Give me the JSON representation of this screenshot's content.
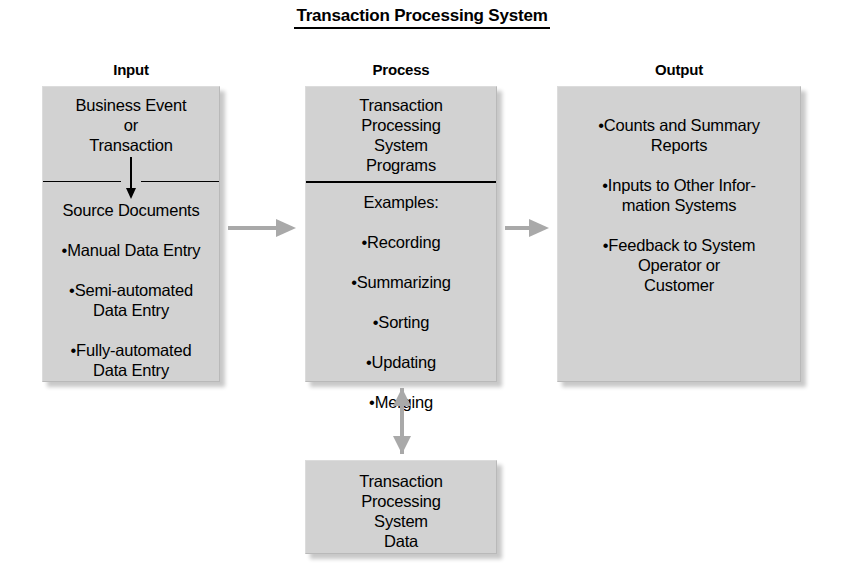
{
  "diagram": {
    "title": "Transaction Processing System",
    "colors": {
      "box_fill": "#d2d2d2",
      "arrow": "#a9a9a9",
      "text": "#000000",
      "background": "#ffffff"
    },
    "columns": [
      {
        "key": "input",
        "header": "Input"
      },
      {
        "key": "process",
        "header": "Process"
      },
      {
        "key": "output",
        "header": "Output"
      }
    ],
    "input_box": {
      "top_text": "Business Event\nor\nTransaction",
      "arrow_icon": "down-arrow-icon",
      "bottom_heading": "Source Documents",
      "bullets": [
        "•Manual Data Entry",
        "•Semi-automated\nData Entry",
        "•Fully-automated\nData Entry"
      ]
    },
    "process_box": {
      "top_text": "Transaction\nProcessing\nSystem\nPrograms",
      "bottom_heading": "Examples:",
      "bullets": [
        "•Recording",
        "•Summarizing",
        "•Sorting",
        "•Updating",
        "•Merging"
      ]
    },
    "output_box": {
      "bullets": [
        "•Counts and Summary\nReports",
        "•Inputs to Other Infor-\nmation Systems",
        "•Feedback to System\nOperator or\nCustomer"
      ]
    },
    "data_box": {
      "text": "Transaction\nProcessing\nSystem\nData"
    },
    "connectors": [
      {
        "name": "input-to-process",
        "style": "single-arrow-right"
      },
      {
        "name": "process-to-output",
        "style": "single-arrow-right"
      },
      {
        "name": "process-to-data",
        "style": "double-arrow-vertical"
      }
    ]
  }
}
